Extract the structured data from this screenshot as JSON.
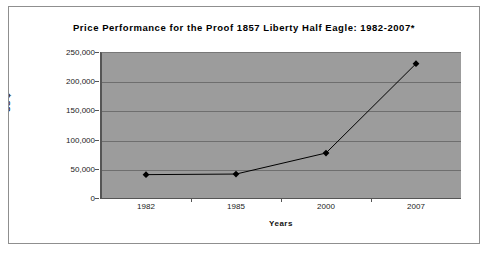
{
  "chart_data": {
    "type": "line",
    "title": "Price Performance for the Proof 1857 Liberty Half Eagle: 1982-2007*",
    "xlabel": "Years",
    "ylabel": "US $",
    "categories": [
      "1982",
      "1985",
      "2000",
      "2007"
    ],
    "series": [
      {
        "name": "Price",
        "values": [
          40000,
          41000,
          77000,
          230000
        ]
      }
    ],
    "ylim": [
      0,
      250000
    ],
    "ytick_values": [
      0,
      50000,
      100000,
      150000,
      200000,
      250000
    ],
    "ytick_labels": [
      "0",
      "50,000",
      "100,000",
      "150,000",
      "200,000",
      "250,000"
    ],
    "grid": true,
    "legend": "none",
    "plot_background_color": "#9c9c9c",
    "gridline_color": "#6e6e6e",
    "series_color": "#000000",
    "marker": "filled-diamond"
  }
}
